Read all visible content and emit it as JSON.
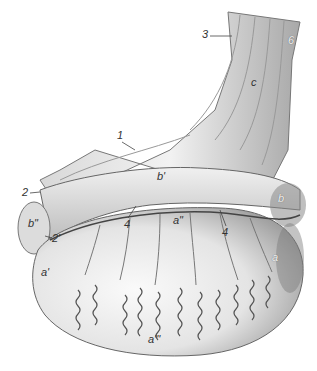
{
  "figure": {
    "colors": {
      "background": "#ffffff",
      "body_light": "#f1f1f1",
      "body_mid": "#c9c9c9",
      "body_dark": "#7a7a7a",
      "vessel": "#555555",
      "outline": "#6a6a6a"
    },
    "labels": [
      {
        "id": "3",
        "text": "3",
        "x": 202,
        "y": 33
      },
      {
        "id": "6",
        "text": "6",
        "x": 290,
        "y": 38
      },
      {
        "id": "c",
        "text": "c",
        "x": 251,
        "y": 80
      },
      {
        "id": "1",
        "text": "1",
        "x": 117,
        "y": 134
      },
      {
        "id": "b-prime",
        "text": "b'",
        "x": 157,
        "y": 174
      },
      {
        "id": "2",
        "text": "2",
        "x": 22,
        "y": 191
      },
      {
        "id": "b",
        "text": "b",
        "x": 278,
        "y": 197
      },
      {
        "id": "b-double-prime",
        "text": "b\"",
        "x": 28,
        "y": 221
      },
      {
        "id": "2-prime",
        "text": "2'",
        "x": 52,
        "y": 237
      },
      {
        "id": "4-left",
        "text": "4",
        "x": 124,
        "y": 221
      },
      {
        "id": "a-double-prime",
        "text": "a\"",
        "x": 175,
        "y": 219
      },
      {
        "id": "4-right",
        "text": "4",
        "x": 223,
        "y": 229
      },
      {
        "id": "a",
        "text": "a",
        "x": 273,
        "y": 256
      },
      {
        "id": "a-prime",
        "text": "a'",
        "x": 41,
        "y": 271
      },
      {
        "id": "a-triple-prime",
        "text": "a'''",
        "x": 150,
        "y": 337
      }
    ]
  }
}
